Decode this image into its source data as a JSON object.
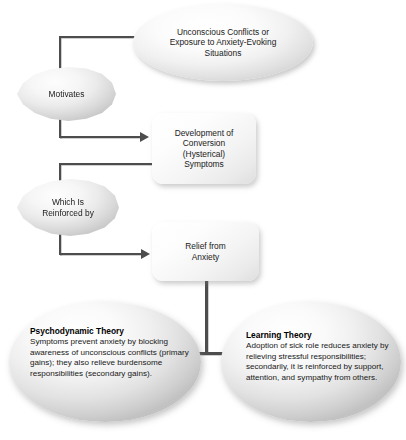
{
  "diagram": {
    "nodes": {
      "unconscious_conflicts": {
        "line1": "Unconscious Conflicts or",
        "line2": "Exposure to Anxiety-Evoking",
        "line3": "Situations"
      },
      "motivates": {
        "label": "Motivates"
      },
      "development": {
        "line1": "Development of",
        "line2": "Conversion",
        "line3": "(Hysterical)",
        "line4": "Symptoms"
      },
      "reinforced": {
        "line1": "Which Is",
        "line2": "Reinforced by"
      },
      "relief": {
        "line1": "Relief from",
        "line2": "Anxiety"
      },
      "psychodynamic_theory": {
        "title": "Psychodynamic Theory",
        "body": "Symptoms prevent anxiety by blocking awareness of unconscious conflicts (primary gains); they also relieve burdensome responsibilities (secondary gains)."
      },
      "learning_theory": {
        "title": "Learning Theory",
        "body": "Adoption of sick role reduces anxiety by relieving stressful responsibilities; secondarily, it is reinforced by support, attention, and sympathy from others."
      }
    },
    "colors": {
      "background": "#ffffff",
      "connector": "#4d4d4d",
      "text": "#1a1a1a",
      "shape_light": "#ffffff",
      "shape_dark": "#c2c2c2"
    }
  }
}
